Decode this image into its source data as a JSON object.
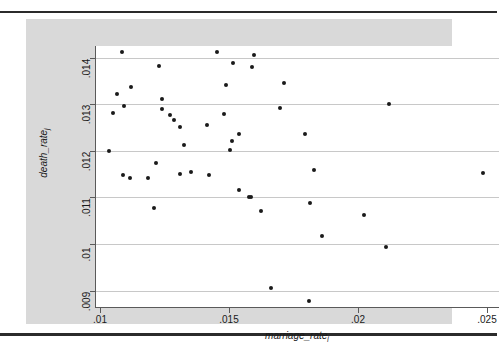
{
  "page": {
    "rule_color": "#2b2b2b",
    "graph_background": "#d9d9d9",
    "plot_background": "#ffffff",
    "gridline_color": "#c8c8c8",
    "marker_color": "#1a1a1a",
    "axis_color": "#5a5a5a"
  },
  "chart_data": {
    "type": "scatter",
    "title": "",
    "xlabel": "marriage_rate",
    "xlabel_subscript": "j",
    "ylabel": "death_rate",
    "ylabel_subscript": "j",
    "xlim": [
      0.0098,
      0.02545
    ],
    "ylim": [
      0.00865,
      0.01425
    ],
    "xticks": [
      0.01,
      0.015,
      0.02,
      0.025
    ],
    "xticklabels": [
      ".01",
      ".015",
      ".02",
      ".025"
    ],
    "yticks": [
      0.009,
      0.01,
      0.011,
      0.012,
      0.013,
      0.014
    ],
    "yticklabels": [
      ".009",
      ".01",
      ".011",
      ".012",
      ".013",
      ".014"
    ],
    "grid": "horizontal",
    "legend": "none",
    "series": [
      {
        "name": "states",
        "marker": "filled-circle",
        "points": [
          {
            "x": 0.01083,
            "y": 0.01412
          },
          {
            "x": 0.01452,
            "y": 0.01412
          },
          {
            "x": 0.01596,
            "y": 0.01405
          },
          {
            "x": 0.01228,
            "y": 0.01383
          },
          {
            "x": 0.01515,
            "y": 0.01388
          },
          {
            "x": 0.01588,
            "y": 0.01381
          },
          {
            "x": 0.01118,
            "y": 0.01337
          },
          {
            "x": 0.01067,
            "y": 0.01322
          },
          {
            "x": 0.01487,
            "y": 0.01341
          },
          {
            "x": 0.01713,
            "y": 0.01345
          },
          {
            "x": 0.01239,
            "y": 0.01311
          },
          {
            "x": 0.01049,
            "y": 0.01282
          },
          {
            "x": 0.01093,
            "y": 0.01296
          },
          {
            "x": 0.01238,
            "y": 0.01289
          },
          {
            "x": 0.01697,
            "y": 0.01293
          },
          {
            "x": 0.02117,
            "y": 0.013
          },
          {
            "x": 0.01272,
            "y": 0.01276
          },
          {
            "x": 0.01286,
            "y": 0.01266
          },
          {
            "x": 0.01478,
            "y": 0.01279
          },
          {
            "x": 0.01309,
            "y": 0.01252
          },
          {
            "x": 0.01412,
            "y": 0.01255
          },
          {
            "x": 0.01538,
            "y": 0.01236
          },
          {
            "x": 0.01792,
            "y": 0.01237
          },
          {
            "x": 0.01323,
            "y": 0.01213
          },
          {
            "x": 0.01509,
            "y": 0.01222
          },
          {
            "x": 0.01504,
            "y": 0.01201
          },
          {
            "x": 0.01036,
            "y": 0.01199
          },
          {
            "x": 0.01216,
            "y": 0.01175
          },
          {
            "x": 0.01087,
            "y": 0.01148
          },
          {
            "x": 0.01117,
            "y": 0.01141
          },
          {
            "x": 0.01186,
            "y": 0.01141
          },
          {
            "x": 0.0131,
            "y": 0.01151
          },
          {
            "x": 0.01353,
            "y": 0.01155
          },
          {
            "x": 0.0142,
            "y": 0.01148
          },
          {
            "x": 0.0183,
            "y": 0.01159
          },
          {
            "x": 0.02482,
            "y": 0.01152
          },
          {
            "x": 0.01538,
            "y": 0.01115
          },
          {
            "x": 0.01575,
            "y": 0.011
          },
          {
            "x": 0.01586,
            "y": 0.01102
          },
          {
            "x": 0.01812,
            "y": 0.01089
          },
          {
            "x": 0.01208,
            "y": 0.01078
          },
          {
            "x": 0.01624,
            "y": 0.01072
          },
          {
            "x": 0.02021,
            "y": 0.01062
          },
          {
            "x": 0.0186,
            "y": 0.01018
          },
          {
            "x": 0.02107,
            "y": 0.00994
          },
          {
            "x": 0.01663,
            "y": 0.00906
          },
          {
            "x": 0.0181,
            "y": 0.00878
          }
        ]
      }
    ]
  }
}
